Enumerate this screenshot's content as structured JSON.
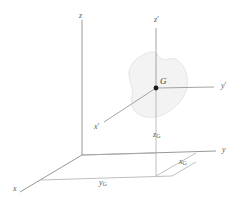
{
  "figure": {
    "type": "3d-coordinate-diagram",
    "background_color": "#ffffff",
    "axis_color": "#8c8c8c",
    "construction_line_color": "#a8a8a8",
    "local_axis_color": "#9a9a9a",
    "body_fill_color": "#f2f2f2",
    "body_stroke_color": "#e0e0e0",
    "point_color": "#1a1a1a",
    "label_color": "#5a5a5a"
  },
  "global_frame": {
    "origin_label": "",
    "axes": [
      {
        "name": "z",
        "label": "z",
        "label_x": 79,
        "label_y": 12
      },
      {
        "name": "y",
        "label": "y",
        "label_x": 222,
        "label_y": 147
      },
      {
        "name": "x",
        "label": "x",
        "label_x": 14,
        "label_y": 186
      }
    ]
  },
  "local_frame": {
    "origin_name": "G",
    "origin_label": "G",
    "origin_label_x": 160,
    "origin_label_y": 78,
    "axes": [
      {
        "name": "z-prime",
        "label": "z",
        "prime": "′",
        "label_x": 155,
        "label_y": 17
      },
      {
        "name": "y-prime",
        "label": "y",
        "prime": "′",
        "label_x": 221,
        "label_y": 83
      },
      {
        "name": "x-prime",
        "label": "x",
        "prime": "′",
        "label_x": 95,
        "label_y": 124
      }
    ]
  },
  "coordinate_labels": [
    {
      "name": "z-sub-G",
      "base": "z",
      "sub": "G",
      "label_x": 154,
      "label_y": 132
    },
    {
      "name": "x-sub-G",
      "base": "x",
      "sub": "G",
      "label_x": 180,
      "label_y": 159
    },
    {
      "name": "y-sub-G",
      "base": "y",
      "sub": "G",
      "label_x": 100,
      "label_y": 180
    }
  ],
  "body": {
    "name": "rigid-body-blob",
    "description": "irregular blob outline representing a rigid body"
  },
  "geometry": {
    "global_origin": {
      "x": 82,
      "y": 155
    },
    "point_G": {
      "x": 156,
      "y": 88
    },
    "ground_projection": {
      "x": 156,
      "y": 155
    }
  }
}
